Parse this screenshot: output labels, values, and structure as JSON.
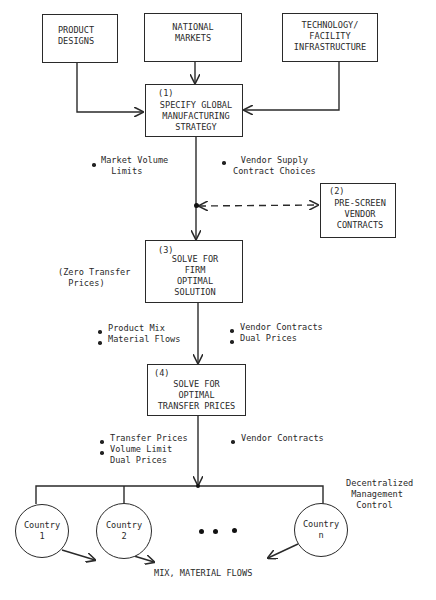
{
  "inputs": {
    "product_designs": "PRODUCT\nDESIGNS",
    "national_markets": "NATIONAL\nMARKETS",
    "technology": "TECHNOLOGY/\nFACILITY\nINFRASTRUCTURE"
  },
  "steps": [
    {
      "number": "(1)",
      "label": "SPECIFY GLOBAL\nMANUFACTURING\nSTRATEGY"
    },
    {
      "number": "(2)",
      "label": "PRE-SCREEN\nVENDOR\nCONTRACTS"
    },
    {
      "number": "(3)",
      "label": "SOLVE FOR\nFIRM\nOPTIMAL\nSOLUTION"
    },
    {
      "number": "(4)",
      "label": "SOLVE FOR\nOPTIMAL\nTRANSFER PRICES"
    }
  ],
  "annotations": {
    "after_step1_left": "Market Volume\n  Limits",
    "after_step1_right": "Vendor Supply\nContract Choices",
    "step3_side": "(Zero Transfer\n  Prices)",
    "after_step3_left": [
      "Product Mix",
      "Material Flows"
    ],
    "after_step3_right": [
      "Vendor Contracts",
      "Dual Prices"
    ],
    "after_step4_left": [
      "Transfer Prices",
      "Volume Limit\nDual Prices"
    ],
    "after_step4_right": [
      "Vendor Contracts"
    ],
    "decentralized": "Decentralized\n Management\n  Control",
    "bottom_output": "MIX, MATERIAL FLOWS"
  },
  "countries": [
    {
      "label": "Country\n1"
    },
    {
      "label": "Country\n2"
    },
    {
      "label": "Country\nn"
    }
  ],
  "ellipsis": "• • •"
}
